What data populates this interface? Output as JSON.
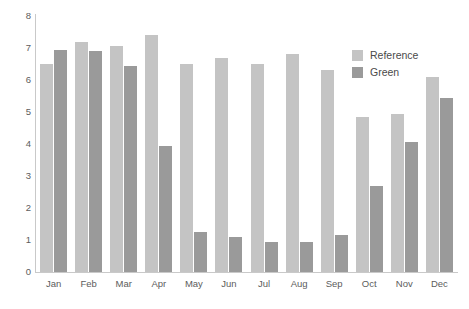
{
  "chart_data": {
    "type": "bar",
    "title": "",
    "subtitle": "",
    "xlabel": "",
    "ylabel": "",
    "categories": [
      "Jan",
      "Feb",
      "Mar",
      "Apr",
      "May",
      "Jun",
      "Jul",
      "Aug",
      "Sep",
      "Oct",
      "Nov",
      "Dec"
    ],
    "series": [
      {
        "name": "Reference",
        "color": "#c4c4c4",
        "values": [
          6.5,
          7.2,
          7.05,
          7.4,
          6.5,
          6.7,
          6.5,
          6.8,
          6.3,
          4.85,
          4.95,
          6.1
        ]
      },
      {
        "name": "Green",
        "color": "#9a9a9a",
        "values": [
          6.95,
          6.9,
          6.45,
          3.95,
          1.25,
          1.1,
          0.95,
          0.95,
          1.15,
          2.7,
          4.05,
          5.45
        ]
      }
    ],
    "ylim": [
      0,
      8
    ],
    "yticks": [
      0,
      1,
      2,
      3,
      4,
      5,
      6,
      7,
      8
    ],
    "ytick_labels": [
      "0",
      "1",
      "2",
      "3",
      "4",
      "5",
      "6",
      "7",
      "8"
    ],
    "grid": false,
    "legend_position": "top-right",
    "axis_color": "#c9c9c9",
    "tick_label_color": "#5c5c5c"
  }
}
